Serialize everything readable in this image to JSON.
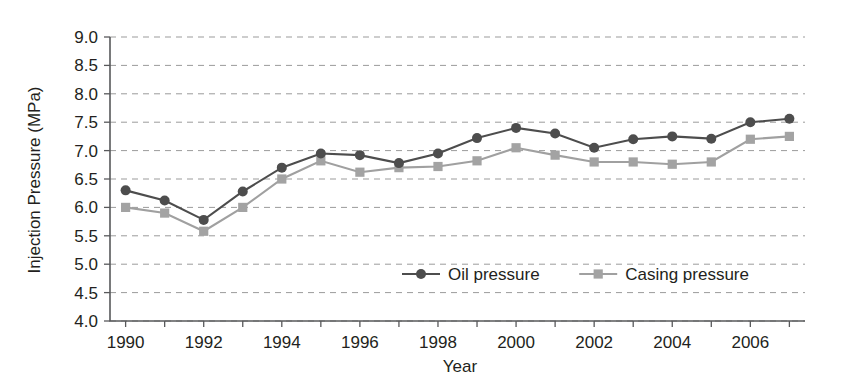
{
  "chart_data": {
    "type": "line",
    "title": "",
    "xlabel": "Year",
    "ylabel": "Injection Pressure (MPa)",
    "xlim": [
      1989.6,
      2007.4
    ],
    "ylim": [
      4.0,
      9.0
    ],
    "grid": "horizontal-dashed",
    "legend_position": "inside-bottom-center",
    "x": [
      1990,
      1991,
      1992,
      1993,
      1994,
      1995,
      1996,
      1997,
      1998,
      1999,
      2000,
      2001,
      2002,
      2003,
      2004,
      2005,
      2006,
      2007
    ],
    "xticks": [
      1990,
      1991,
      1992,
      1993,
      1994,
      1995,
      1996,
      1997,
      1998,
      1999,
      2000,
      2001,
      2002,
      2003,
      2004,
      2005,
      2006,
      2007
    ],
    "xtick_labels": [
      "1990",
      "",
      "1992",
      "",
      "1994",
      "",
      "1996",
      "",
      "1998",
      "",
      "2000",
      "",
      "2002",
      "",
      "2004",
      "",
      "2006",
      ""
    ],
    "yticks": [
      4.0,
      4.5,
      5.0,
      5.5,
      6.0,
      6.5,
      7.0,
      7.5,
      8.0,
      8.5,
      9.0
    ],
    "ytick_labels": [
      "4.0",
      "4.5",
      "5.0",
      "5.5",
      "6.0",
      "6.5",
      "7.0",
      "7.5",
      "8.0",
      "8.5",
      "9.0"
    ],
    "series": [
      {
        "name": "Oil pressure",
        "marker": "circle",
        "color": "#4d4d4d",
        "values": [
          6.3,
          6.12,
          5.78,
          6.28,
          6.7,
          6.95,
          6.92,
          6.78,
          6.95,
          7.22,
          7.4,
          7.3,
          7.05,
          7.2,
          7.25,
          7.21,
          7.5,
          7.56
        ]
      },
      {
        "name": "Casing pressure",
        "marker": "square",
        "color": "#a3a3a3",
        "values": [
          6.0,
          5.9,
          5.58,
          6.0,
          6.5,
          6.82,
          6.62,
          6.7,
          6.72,
          6.82,
          7.05,
          6.92,
          6.8,
          6.8,
          6.76,
          6.8,
          7.2,
          7.25
        ]
      }
    ]
  },
  "legend": {
    "items": [
      {
        "label": "Oil pressure",
        "marker": "circle",
        "color": "#4d4d4d"
      },
      {
        "label": "Casing pressure",
        "marker": "square",
        "color": "#a3a3a3"
      }
    ]
  }
}
